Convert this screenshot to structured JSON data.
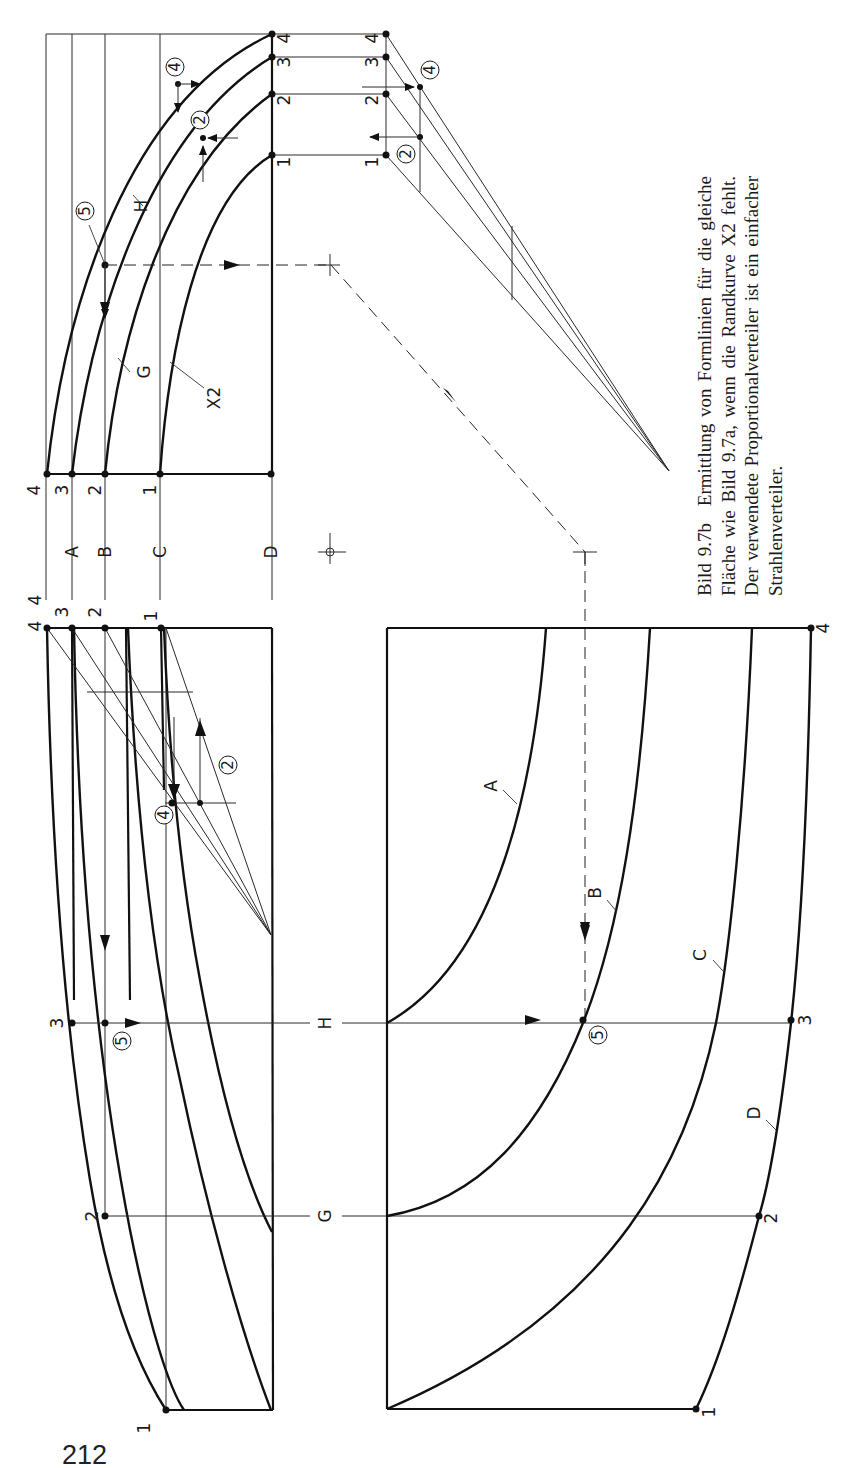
{
  "caption": {
    "figure_label": "Bild 9.7b",
    "text": "Ermittlung von Formlinien für die gleiche Fläche wie Bild 9.7a, wenn die Randkurve X2 fehlt. Der verwendete Proportionalverteiler ist ein einfacher Strahlenverteiler."
  },
  "page_number": "212",
  "labels": {
    "section_lines": [
      "A",
      "B",
      "C",
      "D"
    ],
    "sections_vertical": [
      "H",
      "G"
    ],
    "curve_names_top": [
      "H",
      "G",
      "X2"
    ],
    "curve_names_bottom": [
      "A",
      "B",
      "C",
      "D"
    ],
    "point_numbers": [
      "1",
      "2",
      "3",
      "4"
    ],
    "circled_steps": [
      "2",
      "4",
      "5"
    ]
  },
  "views": {
    "top_view": {
      "name": "Draufsicht (Spanten H, G, X2)",
      "edge_points": [
        "4",
        "3",
        "2",
        "1"
      ]
    },
    "side_view": {
      "name": "Seitenansicht (Linien A–D)",
      "edge_points": [
        "4",
        "4",
        "3",
        "2",
        "1"
      ]
    },
    "bottom_view": {
      "name": "Formlinien A, B, C, D",
      "corner_points": [
        "4",
        "3",
        "2",
        "1"
      ]
    },
    "fan": {
      "name": "Strahlenverteiler",
      "points": [
        "4",
        "3",
        "2",
        "1"
      ]
    }
  }
}
